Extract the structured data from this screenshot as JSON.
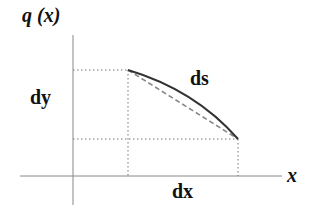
{
  "diagram": {
    "type": "arc-length-element",
    "labels": {
      "y_axis": "q (x)",
      "x_axis": "x",
      "dy": "dy",
      "dx": "dx",
      "ds": "ds"
    },
    "colors": {
      "axes": "#888888",
      "curve": "#333333",
      "chord": "#888888",
      "guides": "#777777",
      "text": "#111111"
    },
    "elements": [
      {
        "name": "y-axis",
        "style": "solid thin gray"
      },
      {
        "name": "x-axis",
        "style": "solid thin gray"
      },
      {
        "name": "curve-arc",
        "style": "solid dark, concave down, from upper-left to lower-right"
      },
      {
        "name": "chord",
        "style": "dashed gray, straight line between arc endpoints"
      },
      {
        "name": "guide-lines",
        "style": "dotted projections to axes"
      }
    ]
  }
}
